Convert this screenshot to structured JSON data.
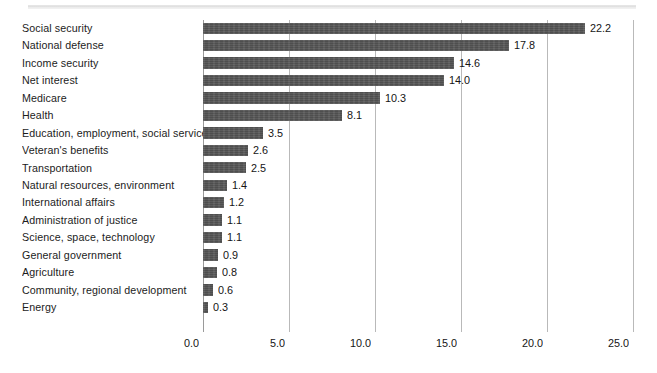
{
  "chart_data": {
    "type": "bar",
    "orientation": "horizontal",
    "title": "",
    "subtitle": "",
    "xlabel": "",
    "ylabel": "",
    "xlim": [
      0.0,
      25.0
    ],
    "grid": true,
    "legend": false,
    "legend_position": "none",
    "value_labels": true,
    "bar_color": "#555555",
    "gridline_color": "#b9b9b9",
    "axis_color": "#9a9a9a",
    "text_color": "#1c1c1c",
    "background": "#ffffff",
    "categories": [
      "Social security",
      "National defense",
      "Income security",
      "Net interest",
      "Medicare",
      "Health",
      "Education, employment, social services",
      "Veteran's benefits",
      "Transportation",
      "Natural resources, environment",
      "International affairs",
      "Administration of justice",
      "Science, space, technology",
      "General government",
      "Agriculture",
      "Community, regional development",
      "Energy"
    ],
    "values": [
      22.2,
      17.8,
      14.6,
      14.0,
      10.3,
      8.1,
      3.5,
      2.6,
      2.5,
      1.4,
      1.2,
      1.1,
      1.1,
      0.9,
      0.8,
      0.6,
      0.3
    ],
    "value_label_texts": [
      "22.2",
      "17.8",
      "14.6",
      "14.0",
      "10.3",
      "8.1",
      "3.5",
      "2.6",
      "2.5",
      "1.4",
      "1.2",
      "1.1",
      "1.1",
      "0.9",
      "0.8",
      "0.6",
      "0.3"
    ],
    "xticks": [
      0.0,
      5.0,
      10.0,
      15.0,
      20.0,
      25.0
    ],
    "xtick_labels": [
      "0.0",
      "5.0",
      "10.0",
      "15.0",
      "20.0",
      "25.0"
    ]
  }
}
